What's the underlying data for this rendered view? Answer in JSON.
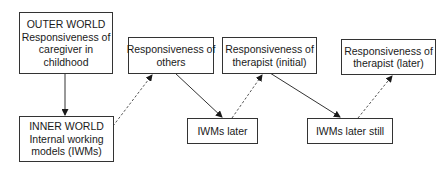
{
  "diagram": {
    "nodes": {
      "outer_world": {
        "lines": [
          "OUTER WORLD",
          "Responsiveness of",
          "caregiver in",
          "childhood"
        ]
      },
      "inner_world": {
        "lines": [
          "INNER WORLD",
          "Internal working",
          "models (IWMs)"
        ]
      },
      "resp_others": {
        "lines": [
          "Responsiveness of",
          "others"
        ]
      },
      "resp_therapist_initial": {
        "lines": [
          "Responsiveness of",
          "therapist (initial)"
        ]
      },
      "resp_therapist_later": {
        "lines": [
          "Responsiveness of",
          "therapist (later)"
        ]
      },
      "iwms_later": {
        "lines": [
          "IWMs later"
        ]
      },
      "iwms_later_still": {
        "lines": [
          "IWMs later still"
        ]
      }
    },
    "edges": [
      {
        "from": "outer_world",
        "to": "inner_world",
        "style": "solid"
      },
      {
        "from": "inner_world",
        "to": "resp_others",
        "style": "dashed"
      },
      {
        "from": "resp_others",
        "to": "iwms_later",
        "style": "solid"
      },
      {
        "from": "iwms_later",
        "to": "resp_therapist_initial",
        "style": "dashed"
      },
      {
        "from": "resp_therapist_initial",
        "to": "iwms_later_still",
        "style": "solid"
      },
      {
        "from": "iwms_later_still",
        "to": "resp_therapist_later",
        "style": "dashed"
      }
    ],
    "colors": {
      "line": "#333333",
      "background": "#ffffff",
      "text": "#1a1a1a"
    }
  }
}
